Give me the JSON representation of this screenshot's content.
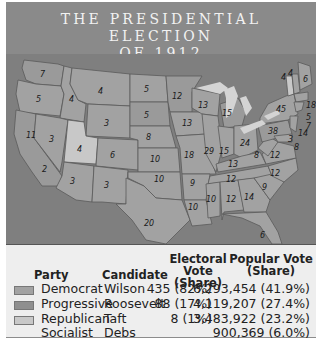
{
  "title": {
    "line1": "THE PRESIDENTIAL ELECTION",
    "line2": "OF 1912"
  },
  "colors": {
    "democrat": "#a2a2a2",
    "progressive": "#8f8f8f",
    "republican": "#c8c8c8",
    "background": "#7f7f7f"
  },
  "map": {
    "states": [
      {
        "name": "WA",
        "votes": "7",
        "party": "progressive"
      },
      {
        "name": "OR",
        "votes": "5",
        "party": "democrat"
      },
      {
        "name": "CA",
        "votes": "11",
        "party": "progressive"
      },
      {
        "name": "ID",
        "votes": "4",
        "party": "democrat"
      },
      {
        "name": "NV",
        "votes": "3",
        "party": "democrat"
      },
      {
        "name": "MT",
        "votes": "4",
        "party": "democrat"
      },
      {
        "name": "WY",
        "votes": "3",
        "party": "democrat"
      },
      {
        "name": "UT",
        "votes": "4",
        "party": "republican"
      },
      {
        "name": "CO",
        "votes": "6",
        "party": "democrat"
      },
      {
        "name": "AZ",
        "votes": "3",
        "party": "democrat"
      },
      {
        "name": "NM",
        "votes": "3",
        "party": "democrat"
      },
      {
        "name": "ND",
        "votes": "5",
        "party": "democrat"
      },
      {
        "name": "SD",
        "votes": "5",
        "party": "progressive"
      },
      {
        "name": "NE",
        "votes": "8",
        "party": "democrat"
      },
      {
        "name": "KS",
        "votes": "10",
        "party": "democrat"
      },
      {
        "name": "OK",
        "votes": "10",
        "party": "democrat"
      },
      {
        "name": "TX",
        "votes": "20",
        "party": "democrat"
      },
      {
        "name": "MN",
        "votes": "12",
        "party": "progressive"
      },
      {
        "name": "IA",
        "votes": "13",
        "party": "democrat"
      },
      {
        "name": "MO",
        "votes": "18",
        "party": "democrat"
      },
      {
        "name": "AR",
        "votes": "9",
        "party": "democrat"
      },
      {
        "name": "LA",
        "votes": "10",
        "party": "democrat"
      },
      {
        "name": "WI",
        "votes": "13",
        "party": "democrat"
      },
      {
        "name": "IL",
        "votes": "29",
        "party": "democrat"
      },
      {
        "name": "MI",
        "votes": "15",
        "party": "progressive"
      },
      {
        "name": "IN",
        "votes": "15",
        "party": "democrat"
      },
      {
        "name": "OH",
        "votes": "24",
        "party": "democrat"
      },
      {
        "name": "KY",
        "votes": "13",
        "party": "democrat"
      },
      {
        "name": "TN",
        "votes": "12",
        "party": "democrat"
      },
      {
        "name": "MS",
        "votes": "10",
        "party": "democrat"
      },
      {
        "name": "AL",
        "votes": "12",
        "party": "democrat"
      },
      {
        "name": "GA",
        "votes": "14",
        "party": "democrat"
      },
      {
        "name": "FL",
        "votes": "6",
        "party": "democrat"
      },
      {
        "name": "SC",
        "votes": "9",
        "party": "democrat"
      },
      {
        "name": "NC",
        "votes": "12",
        "party": "democrat"
      },
      {
        "name": "VA",
        "votes": "12",
        "party": "democrat"
      },
      {
        "name": "WV",
        "votes": "8",
        "party": "democrat"
      },
      {
        "name": "PA",
        "votes": "38",
        "party": "progressive"
      },
      {
        "name": "NY",
        "votes": "45",
        "party": "democrat"
      },
      {
        "name": "VT",
        "votes": "4",
        "party": "republican"
      },
      {
        "name": "NH",
        "votes": "4",
        "party": "democrat"
      },
      {
        "name": "ME",
        "votes": "6",
        "party": "democrat"
      },
      {
        "name": "MA",
        "votes": "18",
        "party": "democrat"
      },
      {
        "name": "RI",
        "votes": "5",
        "party": "democrat"
      },
      {
        "name": "CT",
        "votes": "7",
        "party": "democrat"
      },
      {
        "name": "NJ",
        "votes": "14",
        "party": "democrat"
      },
      {
        "name": "DE",
        "votes": "3",
        "party": "democrat"
      },
      {
        "name": "MD",
        "votes": "8",
        "party": "democrat"
      }
    ]
  },
  "legend": {
    "headers": {
      "party": "Party",
      "candidate": "Candidate",
      "electoral_1": "Electoral Vote",
      "electoral_2": "(Share)",
      "popular_1": "Popular Vote",
      "popular_2": "(Share)"
    },
    "rows": [
      {
        "party": "Democrat",
        "candidate": "Wilson",
        "electoral": "435 (82%)",
        "popular": "6,293,454 (41.9%)",
        "swatch": "#a2a2a2"
      },
      {
        "party": "Progressive",
        "candidate": "Roosevelt",
        "electoral": "88 (17%)",
        "popular": "4,119,207 (27.4%)",
        "swatch": "#8f8f8f"
      },
      {
        "party": "Republican",
        "candidate": "Taft",
        "electoral": "8 (1%)",
        "popular": "3,483,922 (23.2%)",
        "swatch": "#c8c8c8"
      },
      {
        "party": "Socialist",
        "candidate": "Debs",
        "electoral": "",
        "popular": "900,369 (6.0%)",
        "swatch": ""
      }
    ]
  }
}
